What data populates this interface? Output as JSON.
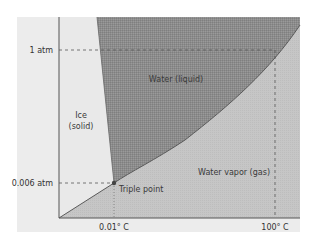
{
  "diagram": {
    "regions": {
      "ice": {
        "line1": "Ice",
        "line2": "(solid)"
      },
      "liquid": {
        "label": "Water (liquid)"
      },
      "vapor": {
        "label": "Water vapor (gas)"
      }
    },
    "points": {
      "triple_point": {
        "label": "Triple point"
      }
    },
    "axes": {
      "y_ticks": {
        "one_atm": "1 atm",
        "triple_pressure": "0.006 atm"
      },
      "x_ticks": {
        "triple_temp": "0.01° C",
        "boiling": "100° C"
      }
    },
    "colors": {
      "panel": "#ececec",
      "ice": "#e9e9e9",
      "liquid": "#8c8c8c",
      "vapor": "#c6c6c6",
      "axis": "#555555",
      "dash": "#555555"
    }
  }
}
